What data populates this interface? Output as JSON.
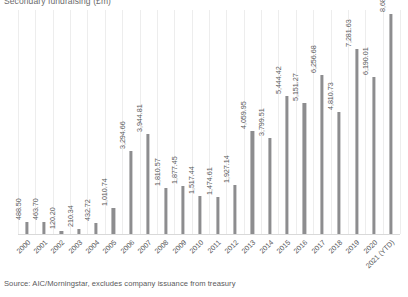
{
  "chart_data": {
    "type": "bar",
    "title": "Secondary fundraising (£m)",
    "xlabel": "",
    "ylabel": "",
    "grid": "vertical-category-gridlines",
    "legend": "none",
    "ylim": [
      0,
      8680.43
    ],
    "categories": [
      "2000",
      "2001",
      "2002",
      "2003",
      "2004",
      "2005",
      "2006",
      "2007",
      "2008",
      "2009",
      "2010",
      "2011",
      "2012",
      "2013",
      "2014",
      "2015",
      "2016",
      "2017",
      "2018",
      "2019",
      "2020",
      "2021 (YTD)"
    ],
    "values": [
      488.5,
      463.7,
      120.2,
      210.34,
      432.72,
      1010.74,
      3294.66,
      3944.81,
      1810.57,
      1877.45,
      1517.44,
      1474.61,
      1927.14,
      4059.95,
      3799.51,
      5444.42,
      5151.27,
      6256.68,
      4810.73,
      7281.63,
      6190.01,
      8680.43
    ],
    "value_labels": [
      "488.50",
      "463.70",
      "120.20",
      "210.34",
      "432.72",
      "1,010.74",
      "3,294.66",
      "3,944.81",
      "1,810.57",
      "1,877.45",
      "1,517.44",
      "1,474.61",
      "1,927.14",
      "4,059.95",
      "3,799.51",
      "5,444.42",
      "5,151.27",
      "6,256.68",
      "4,810.73",
      "7,281.63",
      "6,190.01",
      "8,680.43"
    ],
    "bar_color": "#8d8d8f",
    "gridline_color": "#ededed"
  },
  "source": {
    "text": "Source: AIC/Morningstar, excludes company issuance from treasury"
  }
}
